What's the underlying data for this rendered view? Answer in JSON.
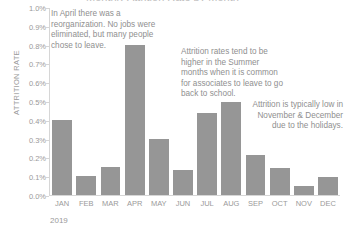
{
  "chart_data": {
    "type": "bar",
    "title": "Monthly Attrition Rate by Month",
    "xlabel": "2019",
    "ylabel": "ATTRITION RATE",
    "categories": [
      "JAN",
      "FEB",
      "MAR",
      "APR",
      "MAY",
      "JUN",
      "JUL",
      "AUG",
      "SEP",
      "OCT",
      "NOV",
      "DEC"
    ],
    "values": [
      0.4,
      0.1,
      0.15,
      0.8,
      0.3,
      0.135,
      0.44,
      0.5,
      0.215,
      0.145,
      0.05,
      0.095
    ],
    "value_unit": "%",
    "ylim": [
      0.0,
      1.0
    ],
    "ytick_labels": [
      "1.0%",
      "0.9%",
      "0.8%",
      "0.7%",
      "0.6%",
      "0.5%",
      "0.4%",
      "0.3%",
      "0.2%",
      "0.1%",
      "0.0%"
    ],
    "ytick_values": [
      1.0,
      0.9,
      0.8,
      0.7,
      0.6,
      0.5,
      0.4,
      0.3,
      0.2,
      0.1,
      0.0
    ],
    "grid": false,
    "legend": "none",
    "bar_color": "#969696",
    "axis_color": "#d6d6d6",
    "text_color": "#9a9a9a",
    "annotations": [
      {
        "id": "april",
        "text": "In April there was a reorganization. No jobs were eliminated, but many people chose to leave.",
        "target_category": "APR"
      },
      {
        "id": "summer",
        "text": "Attrition rates tend to be higher in the Summer months when it is common for associates to leave to go back to school.",
        "target_category": "JUL"
      },
      {
        "id": "holidays",
        "text": "Attrition is typically low in November & December due to the holidays.",
        "target_category": "NOV"
      }
    ]
  }
}
